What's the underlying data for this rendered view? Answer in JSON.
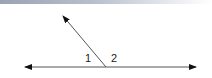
{
  "figure": {
    "type": "linear-pair-angles",
    "colors": {
      "line": "#555555",
      "arrowhead": "#111111",
      "label": "#222222",
      "top_bar_start": "#9aa3b3",
      "top_bar_end": "#ffffff"
    },
    "line": {
      "x1": 25,
      "y1": 67,
      "x2": 196,
      "y2": 67
    },
    "ray": {
      "x1": 106,
      "y1": 67,
      "x2": 63,
      "y2": 16
    },
    "labels": [
      {
        "id": "angle-1",
        "text": "1",
        "x": 85,
        "y": 53
      },
      {
        "id": "angle-2",
        "text": "2",
        "x": 111,
        "y": 53
      }
    ]
  }
}
